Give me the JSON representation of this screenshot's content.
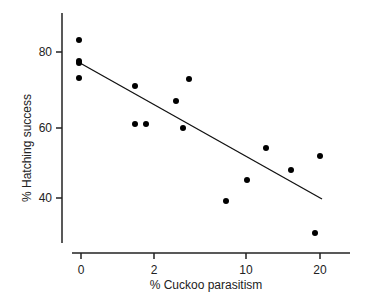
{
  "chart_data": {
    "type": "scatter",
    "title": "",
    "xlabel": "% Cuckoo parasitism",
    "ylabel": "% Hatching success",
    "x_ticks": [
      "0",
      "2",
      "10",
      "20"
    ],
    "y_ticks": [
      "40",
      "60",
      "80"
    ],
    "ylim": [
      28,
      90
    ],
    "grid": false,
    "legend": null,
    "points": [
      {
        "x": 0,
        "y": 83
      },
      {
        "x": 0,
        "y": 77.5
      },
      {
        "x": 0,
        "y": 77
      },
      {
        "x": 0,
        "y": 73
      },
      {
        "x": 1.5,
        "y": 71
      },
      {
        "x": 1.5,
        "y": 61
      },
      {
        "x": 1.8,
        "y": 61
      },
      {
        "x": 3.5,
        "y": 67
      },
      {
        "x": 4,
        "y": 60
      },
      {
        "x": 4.5,
        "y": 73
      },
      {
        "x": 8,
        "y": 39
      },
      {
        "x": 10,
        "y": 45
      },
      {
        "x": 12.5,
        "y": 54
      },
      {
        "x": 16,
        "y": 48
      },
      {
        "x": 20,
        "y": 52
      },
      {
        "x": 19,
        "y": 30
      }
    ],
    "fit_line": {
      "x": [
        0,
        20
      ],
      "y": [
        77,
        39
      ]
    }
  },
  "layout": {
    "x_tick_px": [
      81,
      154,
      246,
      320
    ],
    "y_tick_px": [
      198,
      128,
      52
    ],
    "points_px": [
      [
        79,
        40
      ],
      [
        79,
        61
      ],
      [
        79,
        63
      ],
      [
        79,
        78
      ],
      [
        135,
        86
      ],
      [
        135,
        124
      ],
      [
        146,
        124
      ],
      [
        176,
        101
      ],
      [
        183,
        128
      ],
      [
        189,
        79
      ],
      [
        226,
        201
      ],
      [
        247,
        180
      ],
      [
        266,
        148
      ],
      [
        291,
        170
      ],
      [
        320,
        156
      ],
      [
        315,
        233
      ]
    ],
    "fit_px": [
      [
        80,
        63
      ],
      [
        322,
        199
      ]
    ]
  }
}
